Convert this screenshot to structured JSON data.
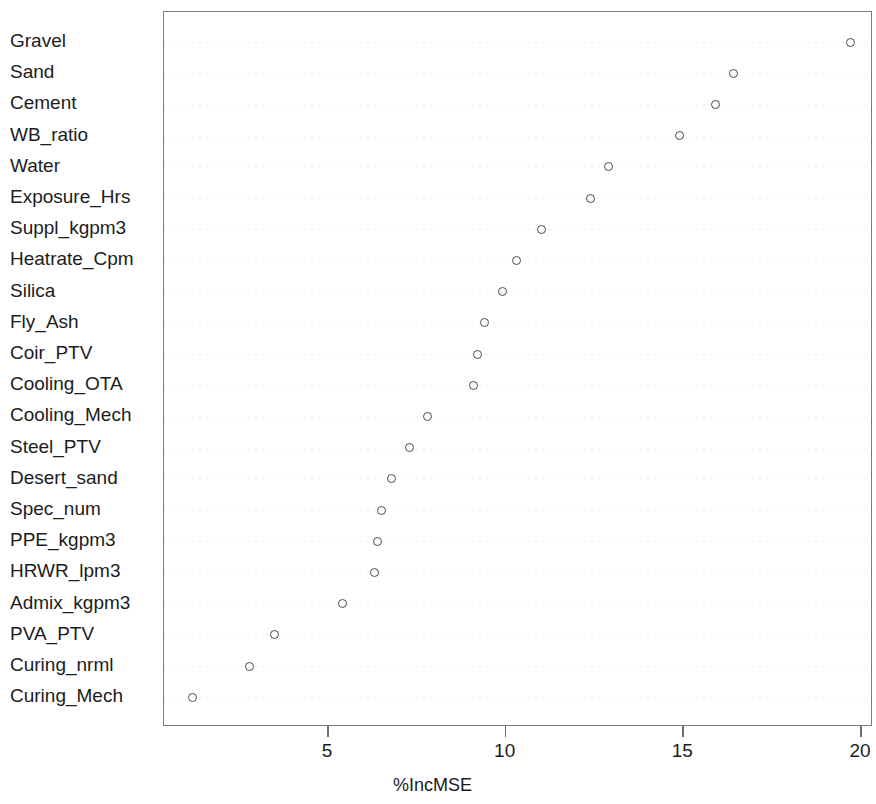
{
  "chart_data": {
    "type": "scatter",
    "title": "",
    "xlabel": "%IncMSE",
    "ylabel": "",
    "xlim": [
      0.5,
      20.6
    ],
    "xticks": [
      5,
      10,
      15,
      20
    ],
    "xtick_labels": [
      "5",
      "10",
      "15",
      "20"
    ],
    "grid": "horizontal-dotted",
    "legend": "none",
    "marker": "open-circle",
    "marker_color": "#4a4a4a",
    "orientation": "dotchart-descending",
    "categories": [
      "Gravel",
      "Sand",
      "Cement",
      "WB_ratio",
      "Water",
      "Exposure_Hrs",
      "Suppl_kgpm3",
      "Heatrate_Cpm",
      "Silica",
      "Fly_Ash",
      "Coir_PTV",
      "Cooling_OTA",
      "Cooling_Mech",
      "Steel_PTV",
      "Desert_sand",
      "Spec_num",
      "PPE_kgpm3",
      "HRWR_lpm3",
      "Admix_kgpm3",
      "PVA_PTV",
      "Curing_nrml",
      "Curing_Mech"
    ],
    "values": [
      19.7,
      16.4,
      15.9,
      14.9,
      12.9,
      12.4,
      11.0,
      10.3,
      9.9,
      9.4,
      9.2,
      9.1,
      7.8,
      7.3,
      6.8,
      6.5,
      6.4,
      6.3,
      5.4,
      3.5,
      2.8,
      1.2
    ]
  }
}
